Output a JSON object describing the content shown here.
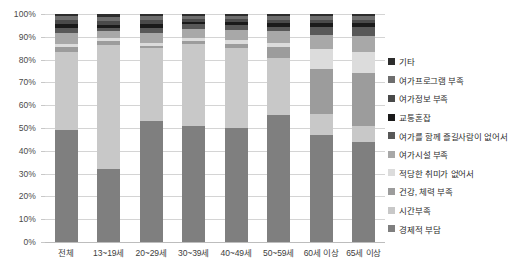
{
  "chart_data": {
    "type": "bar",
    "variant": "stacked-100-percent",
    "title": "",
    "xlabel": "",
    "ylabel": "",
    "ylim": [
      0,
      100
    ],
    "ytick_labels": [
      "0%",
      "10%",
      "20%",
      "30%",
      "40%",
      "50%",
      "60%",
      "70%",
      "80%",
      "90%",
      "100%"
    ],
    "ytick_values": [
      0,
      10,
      20,
      30,
      40,
      50,
      60,
      70,
      80,
      90,
      100
    ],
    "grid": true,
    "legend_position": "right",
    "categories": [
      "전체",
      "13~19세",
      "20~29세",
      "30~39세",
      "40~49세",
      "50~59세",
      "60세 이상",
      "65세 이상"
    ],
    "series": [
      {
        "name": "경제적 부담",
        "color": "#7f7f7f",
        "values": [
          49.0,
          32.0,
          53.0,
          51.0,
          50.0,
          55.5,
          47.0,
          44.0
        ]
      },
      {
        "name": "시간부족",
        "color": "#c8c8c8",
        "values": [
          34.5,
          54.5,
          32.0,
          36.0,
          35.0,
          25.0,
          9.0,
          7.0
        ]
      },
      {
        "name": "건강, 체력 부족",
        "color": "#9c9c9c",
        "values": [
          2.0,
          1.5,
          1.0,
          1.0,
          2.0,
          5.0,
          20.0,
          23.0
        ]
      },
      {
        "name": "적당한 취미가 없어서",
        "color": "#dcdcdc",
        "values": [
          1.5,
          1.5,
          1.5,
          1.5,
          1.5,
          2.0,
          8.5,
          9.5
        ]
      },
      {
        "name": "여가시설 부족",
        "color": "#a8a8a8",
        "values": [
          4.5,
          3.0,
          4.0,
          4.0,
          4.5,
          5.0,
          6.5,
          7.0
        ]
      },
      {
        "name": "여가를 함께 즐길사람이 없어서",
        "color": "#585858",
        "values": [
          2.5,
          1.5,
          2.5,
          2.0,
          2.0,
          2.0,
          3.5,
          4.0
        ]
      },
      {
        "name": "교통혼잡",
        "color": "#1a1a1a",
        "values": [
          1.5,
          1.0,
          1.5,
          1.0,
          1.5,
          1.5,
          1.5,
          1.5
        ]
      },
      {
        "name": "여가정보 부족",
        "color": "#4a4a4a",
        "values": [
          2.0,
          2.0,
          2.0,
          1.5,
          1.5,
          1.5,
          1.5,
          1.5
        ]
      },
      {
        "name": "여가프로그램 부족",
        "color": "#6e6e6e",
        "values": [
          1.5,
          1.5,
          1.5,
          1.0,
          1.0,
          1.5,
          1.5,
          1.5
        ]
      },
      {
        "name": "기타",
        "color": "#2d2d2d",
        "values": [
          1.0,
          1.5,
          1.0,
          1.0,
          1.0,
          1.0,
          1.0,
          1.0
        ]
      }
    ],
    "legend_entries_top_to_bottom": [
      "기타",
      "여가프로그램 부족",
      "여가정보 부족",
      "교통혼잡",
      "여가를 함께 즐길사람이 없어서",
      "여가시설 부족",
      "적당한 취미가 없어서",
      "건강, 체력 부족",
      "시간부족",
      "경제적 부담"
    ]
  },
  "style": {
    "background": "#ffffff",
    "gridline_color": "#d4d4d4",
    "axis_text_color": "#4a4a4a"
  }
}
